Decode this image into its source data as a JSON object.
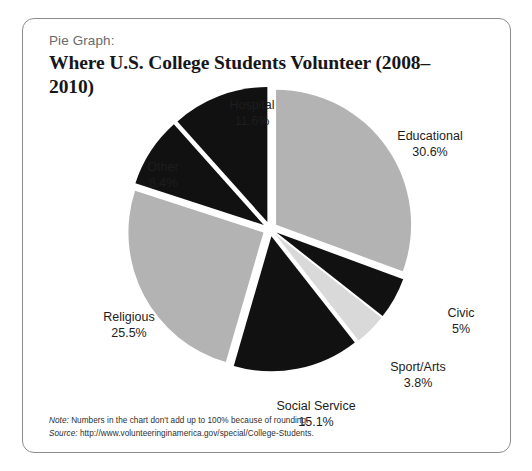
{
  "figure": {
    "kicker": "Pie Graph:",
    "headline": "Where U.S. College Students Volunteer (2008–2010)"
  },
  "notes": {
    "note_lead": "Note:",
    "note_text": " Numbers in the chart don't add up to 100% because of rounding.",
    "source_lead": "Source:",
    "source_text": " http://www.volunteeringinamerica.gov/special/College-Students."
  },
  "labels": {
    "hospital": {
      "name": "Hospital",
      "value": "11.6%"
    },
    "educational": {
      "name": "Educational",
      "value": "30.6%"
    },
    "civic": {
      "name": "Civic",
      "value": "5%"
    },
    "sportarts": {
      "name": "Sport/Arts",
      "value": "3.8%"
    },
    "socialservice": {
      "name": "Social Service",
      "value": "15.1%"
    },
    "religious": {
      "name": "Religious",
      "value": "25.5%"
    },
    "other": {
      "name": "Other",
      "value": "8.4%"
    }
  },
  "chart_data": {
    "type": "pie",
    "title": "Where U.S. College Students Volunteer (2008–2010)",
    "subtitle": "Pie Graph:",
    "exploded": true,
    "start_angle_deg": 0,
    "direction": "clockwise",
    "legend": "none (direct labels)",
    "grid": false,
    "categories": [
      "Educational",
      "Civic",
      "Sport/Arts",
      "Social Service",
      "Religious",
      "Other",
      "Hospital"
    ],
    "values": [
      30.6,
      5.0,
      3.8,
      15.1,
      25.5,
      8.4,
      11.6
    ],
    "value_labels": [
      "30.6%",
      "5%",
      "3.8%",
      "15.1%",
      "25.5%",
      "8.4%",
      "11.6%"
    ],
    "colors": [
      "#b3b3b3",
      "#111111",
      "#d9d9d9",
      "#111111",
      "#b3b3b3",
      "#111111",
      "#111111"
    ],
    "total": 100.0,
    "units": "percent",
    "note": "Numbers in the chart don't add up to 100% because of rounding.",
    "source": "http://www.volunteeringinamerica.gov/special/College-Students."
  },
  "colors": {
    "slice_gray": "#b3b3b3",
    "slice_light_gray": "#d9d9d9",
    "slice_black": "#111111",
    "frame_border": "#8d8d8d",
    "kicker_text": "#6a6a6a",
    "headline_text": "#17171a"
  }
}
